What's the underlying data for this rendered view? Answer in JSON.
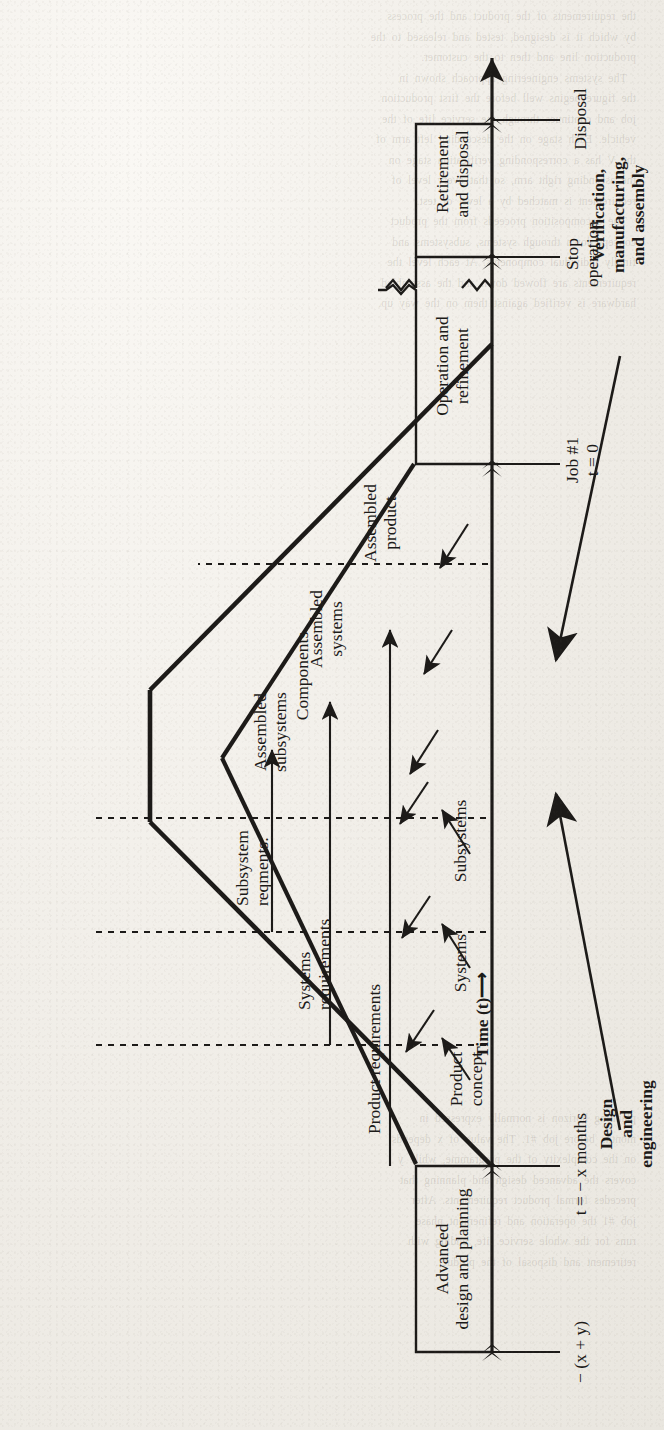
{
  "figure": {
    "orientation": "rotated-90-ccw",
    "ink_color": "#1c1a18",
    "paper_color": "#f2f0ec"
  },
  "axis": {
    "label": "Time (t)",
    "arrow": "⟶",
    "direction": "left-to-right"
  },
  "time_markers": [
    {
      "id": "start",
      "label": "− (x + y)"
    },
    {
      "id": "x-months",
      "label": "t = − x months"
    },
    {
      "id": "job1",
      "label": "Job #1\nt = 0"
    },
    {
      "id": "stop-op",
      "label": "Stop\noperation"
    },
    {
      "id": "disposal",
      "label": "Disposal"
    }
  ],
  "phases": [
    {
      "id": "advanced-design",
      "label": "Advanced\ndesign and planning"
    },
    {
      "id": "operation",
      "label": "Operation and\nrefinement"
    },
    {
      "id": "retirement",
      "label": "Retirement\nand disposal"
    }
  ],
  "left_arm_levels": [
    {
      "id": "product-requirements",
      "label": "Product requirements"
    },
    {
      "id": "systems-requirements",
      "label": "Systems\nrequirements"
    },
    {
      "id": "subsystem-reqments",
      "label": "Subsystem\nreqments."
    }
  ],
  "right_arm_levels": [
    {
      "id": "assembled-product",
      "label": "Assembled\nproduct"
    },
    {
      "id": "assembled-systems",
      "label": "Assembled\nsystems"
    },
    {
      "id": "assembled-subsystems",
      "label": "Assembled\nsubsystems"
    }
  ],
  "decomposition_levels": [
    {
      "id": "product-concept",
      "label": "Product\nconcept"
    },
    {
      "id": "systems",
      "label": "Systems"
    },
    {
      "id": "subsystems",
      "label": "Subsystems"
    },
    {
      "id": "components",
      "label": "Components"
    }
  ],
  "flow_annotations": [
    {
      "id": "design-and-engineering",
      "label": "Design\nand\nengineering",
      "bold": true
    },
    {
      "id": "verification-manufacturing-assembly",
      "label": "Verification,\nmanufacturing,\nand assembly",
      "bold": true
    }
  ],
  "page_bleed_through": {
    "visible": true,
    "note": "faint mirrored text from reverse side of the scanned page"
  }
}
